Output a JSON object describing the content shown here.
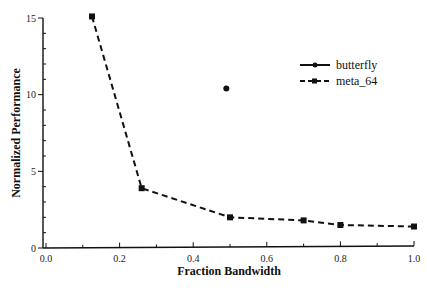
{
  "chart_data": {
    "type": "line",
    "title": "",
    "xlabel": "Fraction Bandwidth",
    "ylabel": "Normalized Performance",
    "xlim": [
      0.0,
      1.0
    ],
    "ylim": [
      0,
      15
    ],
    "x_ticks": [
      "0.0",
      "0.2",
      "0.4",
      "0.6",
      "0.8",
      "1.0"
    ],
    "y_ticks": [
      "0",
      "5",
      "10",
      "15"
    ],
    "grid": false,
    "legend_position": "upper right",
    "series": [
      {
        "name": "butterfly",
        "style": "solid",
        "marker": "circle",
        "x": [
          0.49
        ],
        "y": [
          10.4
        ]
      },
      {
        "name": "meta_64",
        "style": "dashed",
        "marker": "square",
        "x": [
          0.125,
          0.26,
          0.5,
          0.7,
          0.8,
          1.0
        ],
        "y": [
          15.1,
          3.9,
          2.0,
          1.8,
          1.5,
          1.4
        ]
      }
    ]
  },
  "legend": {
    "items": [
      {
        "label": "butterfly"
      },
      {
        "label": "meta_64"
      }
    ]
  }
}
